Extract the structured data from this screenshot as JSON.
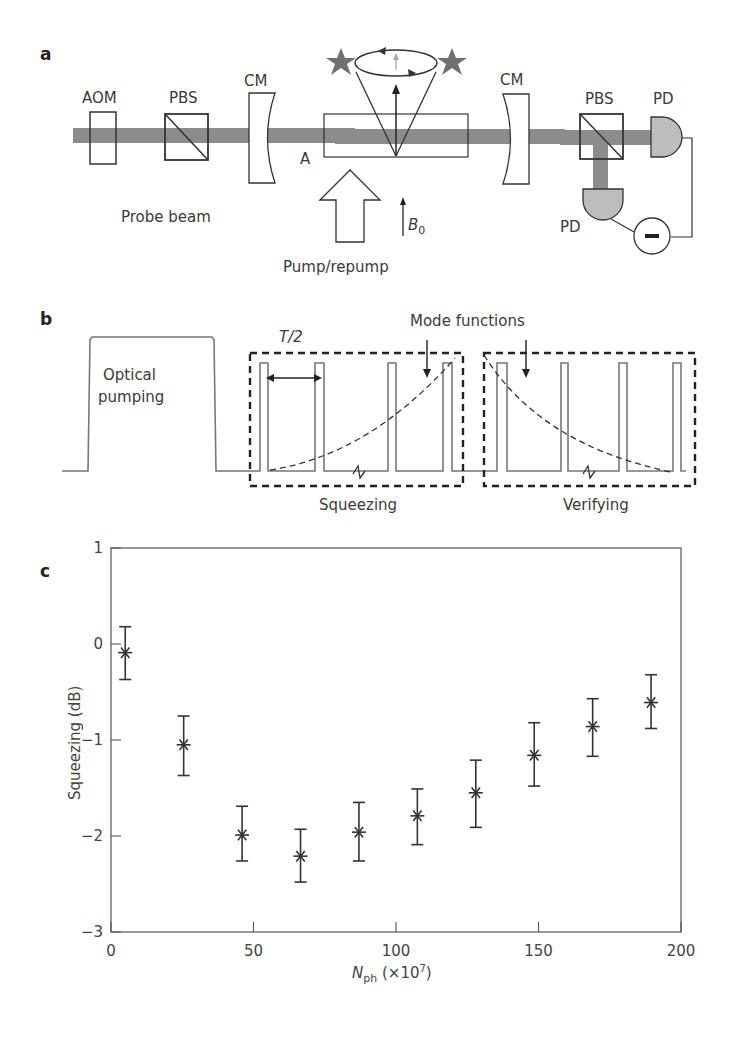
{
  "panels": {
    "a": {
      "label": "a",
      "components": {
        "aom": "AOM",
        "pbs_left": "PBS",
        "cm_left": "CM",
        "cell": "A",
        "cm_right": "CM",
        "pbs_right": "PBS",
        "pd_top": "PD",
        "pd_bottom": "PD",
        "probe_beam": "Probe beam",
        "pump": "Pump/repump",
        "field": "B",
        "field_sub": "0",
        "subtractor": "−"
      },
      "colors": {
        "beam": "#8c8c8c",
        "pd_fill": "#bdbdbd",
        "star": "#6e6e6e"
      }
    },
    "b": {
      "label": "b",
      "optical_pumping_line1": "Optical",
      "optical_pumping_line2": "pumping",
      "period": "T/2",
      "mode_functions": "Mode functions",
      "squeezing": "Squeezing",
      "verifying": "Verifying"
    },
    "c": {
      "label": "c"
    }
  },
  "chart_data": {
    "type": "scatter",
    "title": "",
    "xlabel": "N_ph (×10^7)",
    "xlabel_main": "N",
    "xlabel_sub": "ph",
    "xlabel_rest": " (×10",
    "xlabel_sup": "7",
    "xlabel_close": ")",
    "ylabel": "Squeezing (dB)",
    "xlim": [
      0,
      200
    ],
    "ylim": [
      -3,
      1
    ],
    "xticks": [
      0,
      50,
      100,
      150,
      200
    ],
    "yticks": [
      1,
      0,
      -1,
      -2,
      -3
    ],
    "xtick_labels": [
      "0",
      "50",
      "100",
      "150",
      "200"
    ],
    "ytick_labels": [
      "1",
      "0",
      "−1",
      "−2",
      "−3"
    ],
    "grid": false,
    "marker": "asterisk",
    "series": [
      {
        "name": "Squeezing",
        "x": [
          5,
          25.5,
          46,
          66.5,
          87,
          107.5,
          128,
          148.5,
          169,
          189.5
        ],
        "y": [
          -0.09,
          -1.05,
          -1.99,
          -2.21,
          -1.96,
          -1.79,
          -1.55,
          -1.16,
          -0.86,
          -0.61
        ],
        "err_low": [
          -0.37,
          -1.37,
          -2.26,
          -2.48,
          -2.26,
          -2.09,
          -1.91,
          -1.48,
          -1.17,
          -0.88
        ],
        "err_high": [
          0.18,
          -0.75,
          -1.69,
          -1.93,
          -1.65,
          -1.51,
          -1.21,
          -0.82,
          -0.57,
          -0.32
        ]
      }
    ]
  }
}
